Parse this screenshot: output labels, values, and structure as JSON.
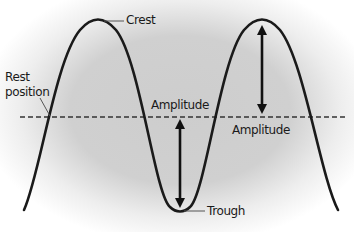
{
  "diagram": {
    "labels": {
      "crest": "Crest",
      "trough": "Trough",
      "rest_line1": "Rest",
      "rest_line2": "position",
      "amplitude_left": "Amplitude",
      "amplitude_right": "Amplitude"
    },
    "colors": {
      "background_center": "#cfcfcf",
      "background_edge": "#ffffff",
      "wave": "#1a1a1a",
      "dashed_line": "#333333",
      "leader_line": "#555555",
      "arrow": "#111111"
    },
    "geometry": {
      "rest_y": 117,
      "crest_y": 21,
      "trough_y": 210,
      "crest_1_x": 98,
      "trough_x": 180,
      "crest_2_x": 262
    }
  }
}
